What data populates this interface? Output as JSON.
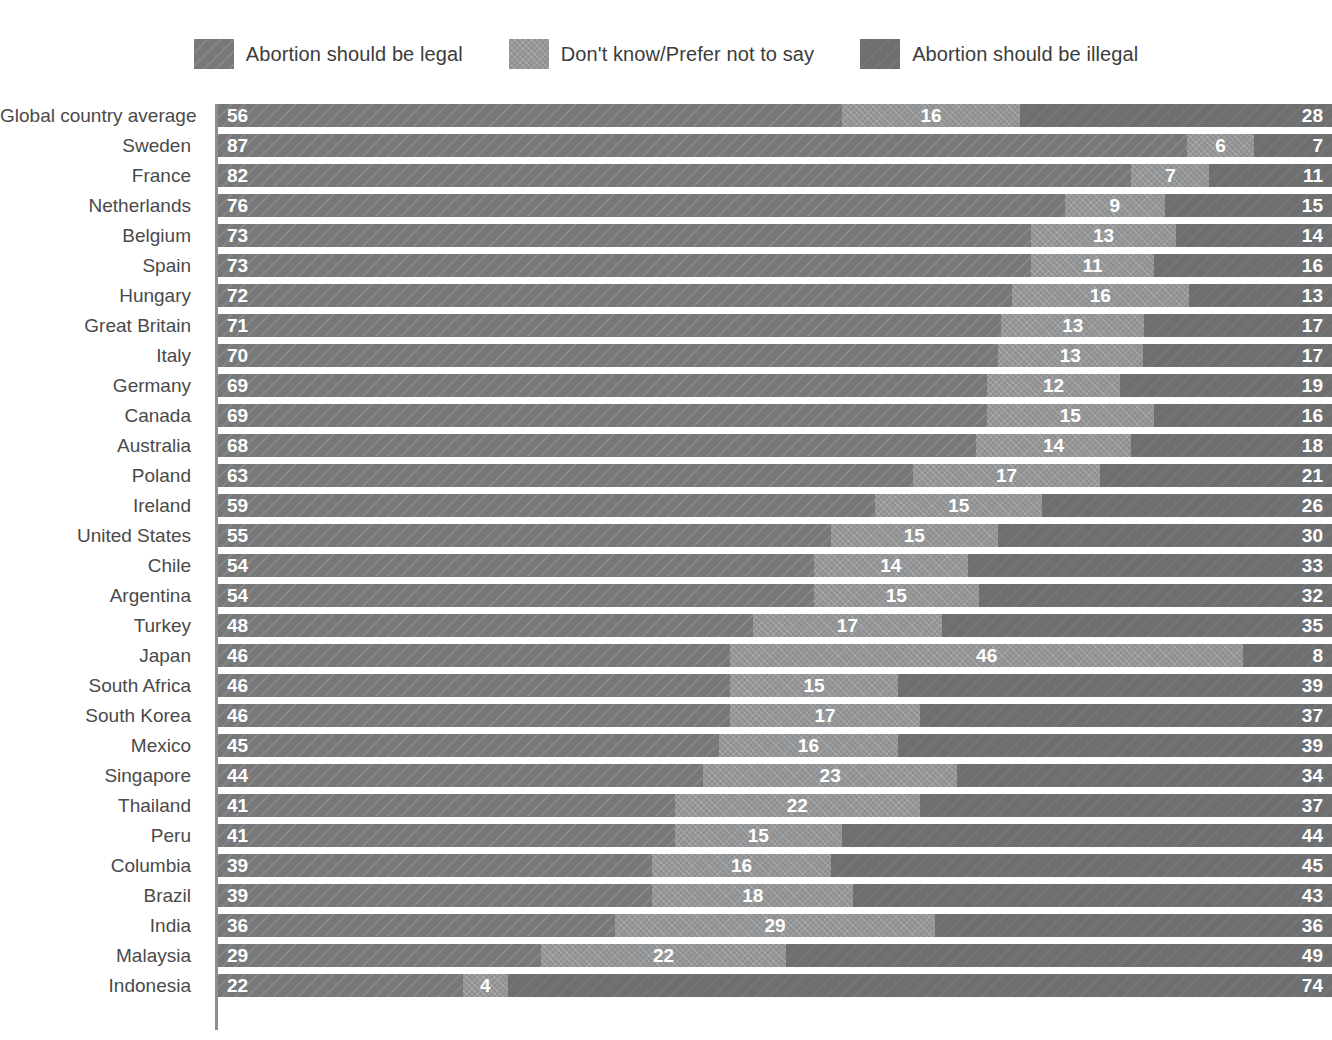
{
  "legend": {
    "items": [
      {
        "label": "Abortion should be legal",
        "color": "#77787a",
        "key": "legal"
      },
      {
        "label": "Don't know/Prefer not to say",
        "color": "#8e9092",
        "key": "dont_know"
      },
      {
        "label": "Abortion should be illegal",
        "color": "#6e6f71",
        "key": "illegal"
      }
    ]
  },
  "chart_data": {
    "type": "bar",
    "subtype": "stacked-horizontal-100pct",
    "title": "",
    "xlabel": "",
    "ylabel": "",
    "xlim": [
      0,
      100
    ],
    "grid": false,
    "legend_position": "top-center",
    "categories": [
      "Global country average",
      "Sweden",
      "France",
      "Netherlands",
      "Belgium",
      "Spain",
      "Hungary",
      "Great Britain",
      "Italy",
      "Germany",
      "Canada",
      "Australia",
      "Poland",
      "Ireland",
      "United States",
      "Chile",
      "Argentina",
      "Turkey",
      "Japan",
      "South Africa",
      "South Korea",
      "Mexico",
      "Singapore",
      "Thailand",
      "Peru",
      "Columbia",
      "Brazil",
      "India",
      "Malaysia",
      "Indonesia"
    ],
    "series": [
      {
        "name": "Abortion should be legal",
        "key": "legal",
        "color": "#77787a",
        "values": [
          56,
          87,
          82,
          76,
          73,
          73,
          72,
          71,
          70,
          69,
          69,
          68,
          63,
          59,
          55,
          54,
          54,
          48,
          46,
          46,
          46,
          45,
          44,
          41,
          41,
          39,
          39,
          36,
          29,
          22
        ]
      },
      {
        "name": "Don't know/Prefer not to say",
        "key": "dont_know",
        "color": "#8e9092",
        "values": [
          16,
          6,
          7,
          9,
          13,
          11,
          16,
          13,
          13,
          12,
          15,
          14,
          17,
          15,
          15,
          14,
          15,
          17,
          46,
          15,
          17,
          16,
          23,
          22,
          15,
          16,
          18,
          29,
          22,
          4
        ]
      },
      {
        "name": "Abortion should be illegal",
        "key": "illegal",
        "color": "#6e6f71",
        "values": [
          28,
          7,
          11,
          15,
          14,
          16,
          13,
          17,
          17,
          19,
          16,
          18,
          21,
          26,
          30,
          33,
          32,
          35,
          8,
          39,
          37,
          39,
          34,
          37,
          44,
          45,
          43,
          36,
          49,
          74
        ]
      }
    ],
    "rows": [
      {
        "label": "Global country average",
        "legal": 56,
        "dont_know": 16,
        "illegal": 28
      },
      {
        "label": "Sweden",
        "legal": 87,
        "dont_know": 6,
        "illegal": 7
      },
      {
        "label": "France",
        "legal": 82,
        "dont_know": 7,
        "illegal": 11
      },
      {
        "label": "Netherlands",
        "legal": 76,
        "dont_know": 9,
        "illegal": 15
      },
      {
        "label": "Belgium",
        "legal": 73,
        "dont_know": 13,
        "illegal": 14
      },
      {
        "label": "Spain",
        "legal": 73,
        "dont_know": 11,
        "illegal": 16
      },
      {
        "label": "Hungary",
        "legal": 72,
        "dont_know": 16,
        "illegal": 13
      },
      {
        "label": "Great Britain",
        "legal": 71,
        "dont_know": 13,
        "illegal": 17
      },
      {
        "label": "Italy",
        "legal": 70,
        "dont_know": 13,
        "illegal": 17
      },
      {
        "label": "Germany",
        "legal": 69,
        "dont_know": 12,
        "illegal": 19
      },
      {
        "label": "Canada",
        "legal": 69,
        "dont_know": 15,
        "illegal": 16
      },
      {
        "label": "Australia",
        "legal": 68,
        "dont_know": 14,
        "illegal": 18
      },
      {
        "label": "Poland",
        "legal": 63,
        "dont_know": 17,
        "illegal": 21
      },
      {
        "label": "Ireland",
        "legal": 59,
        "dont_know": 15,
        "illegal": 26
      },
      {
        "label": "United States",
        "legal": 55,
        "dont_know": 15,
        "illegal": 30
      },
      {
        "label": "Chile",
        "legal": 54,
        "dont_know": 14,
        "illegal": 33
      },
      {
        "label": "Argentina",
        "legal": 54,
        "dont_know": 15,
        "illegal": 32
      },
      {
        "label": "Turkey",
        "legal": 48,
        "dont_know": 17,
        "illegal": 35
      },
      {
        "label": "Japan",
        "legal": 46,
        "dont_know": 46,
        "illegal": 8
      },
      {
        "label": "South Africa",
        "legal": 46,
        "dont_know": 15,
        "illegal": 39
      },
      {
        "label": "South Korea",
        "legal": 46,
        "dont_know": 17,
        "illegal": 37
      },
      {
        "label": "Mexico",
        "legal": 45,
        "dont_know": 16,
        "illegal": 39
      },
      {
        "label": "Singapore",
        "legal": 44,
        "dont_know": 23,
        "illegal": 34
      },
      {
        "label": "Thailand",
        "legal": 41,
        "dont_know": 22,
        "illegal": 37
      },
      {
        "label": "Peru",
        "legal": 41,
        "dont_know": 15,
        "illegal": 44
      },
      {
        "label": "Columbia",
        "legal": 39,
        "dont_know": 16,
        "illegal": 45
      },
      {
        "label": "Brazil",
        "legal": 39,
        "dont_know": 18,
        "illegal": 43
      },
      {
        "label": "India",
        "legal": 36,
        "dont_know": 29,
        "illegal": 36
      },
      {
        "label": "Malaysia",
        "legal": 29,
        "dont_know": 22,
        "illegal": 49
      },
      {
        "label": "Indonesia",
        "legal": 22,
        "dont_know": 4,
        "illegal": 74
      }
    ]
  }
}
